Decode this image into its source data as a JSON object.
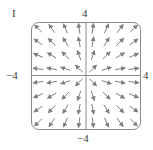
{
  "chart_data": {
    "type": "vector_field",
    "panel_label": "I",
    "title": "",
    "xlabel": "",
    "ylabel": "",
    "xlim": [
      -4,
      4
    ],
    "ylim": [
      -4,
      4
    ],
    "tick_labels": {
      "x_min": "−4",
      "x_max": "4",
      "y_min": "−4",
      "y_max": "4"
    },
    "field": "F(x, y) = (x, y) (radial, pointing outward from origin)",
    "normalized_arrows": true,
    "grid_points_x": [
      -3.5,
      -2.5,
      -1.5,
      -0.5,
      0.5,
      1.5,
      2.5,
      3.5
    ],
    "grid_points_y": [
      -3.5,
      -2.5,
      -1.5,
      -0.5,
      0.5,
      1.5,
      2.5,
      3.5
    ],
    "axes_shown": true,
    "frame": "rounded-square",
    "arrow_color": "#808080",
    "frame_color": "#8a8a8a"
  }
}
